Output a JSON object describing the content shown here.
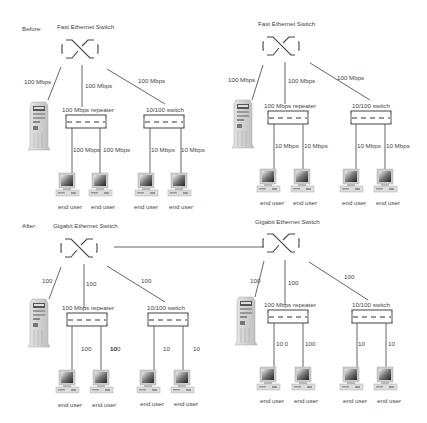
{
  "diagram": {
    "sections": [
      {
        "id": "before",
        "label": "Before:",
        "networks": [
          {
            "switch_title": "Fast Ethernet Switch",
            "server_link": "100 Mbps",
            "repeater_link": "100 Mbps",
            "switch_link": "100 Mbps",
            "repeater_label": "100 Mbps repeater",
            "switch_label": "10/100 switch",
            "repeater_user_links": [
              "100 Mbps",
              "100 Mbps"
            ],
            "switch_user_links": [
              "10 Mbps",
              "10 Mbps"
            ],
            "users": [
              "end user",
              "end user",
              "end user",
              "end user"
            ]
          },
          {
            "switch_title": "Fast Ethernet Switch",
            "server_link": "100 Mbps",
            "repeater_link": "100 Mbps",
            "switch_link": "100 Mbps",
            "repeater_label": "100 Mbps repeater",
            "switch_label": "10/100 switch",
            "repeater_user_links": [
              "10 Mbps",
              "10 Mbps"
            ],
            "switch_user_links": [
              "10 Mbps",
              "10 Mbps"
            ],
            "users": [
              "end user",
              "end user",
              "end user",
              "end user"
            ]
          }
        ]
      },
      {
        "id": "after",
        "label": "After:",
        "networks": [
          {
            "switch_title": "Gigabit Ethernet Switch",
            "server_link": "100",
            "repeater_link": "100",
            "switch_link": "100",
            "repeater_label": "100 Mbps repeater",
            "switch_label": "10/100 switch",
            "repeater_user_links": [
              "100",
              "100"
            ],
            "switch_user_links": [
              "10",
              "10"
            ],
            "users": [
              "end user",
              "end user",
              "end user",
              "end user"
            ]
          },
          {
            "switch_title": "Gigabit Ethernet Switch",
            "server_link": "100",
            "repeater_link": "100",
            "switch_link": "100",
            "repeater_label": "100 Mbps repeater",
            "switch_label": "10/100 switch",
            "repeater_user_links": [
              "10 0",
              "100"
            ],
            "switch_user_links": [
              "10",
              "10"
            ],
            "users": [
              "end user",
              "end user",
              "end user",
              "end user"
            ]
          }
        ]
      }
    ]
  }
}
